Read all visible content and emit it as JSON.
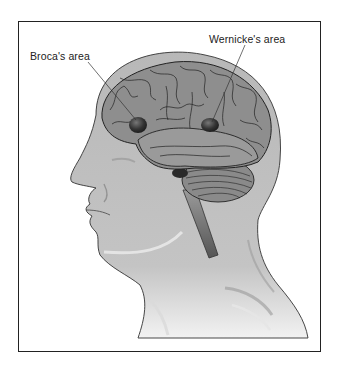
{
  "diagram": {
    "labels": [
      {
        "id": "broca",
        "text": "Broca's area"
      },
      {
        "id": "wernicke",
        "text": "Wernicke's area"
      }
    ],
    "colors": {
      "border": "#222222",
      "head_fill": "#bdbdbd",
      "brain_fill": "#8c8c8c",
      "area_highlight": "#3a3a3a",
      "background": "#ffffff"
    }
  }
}
